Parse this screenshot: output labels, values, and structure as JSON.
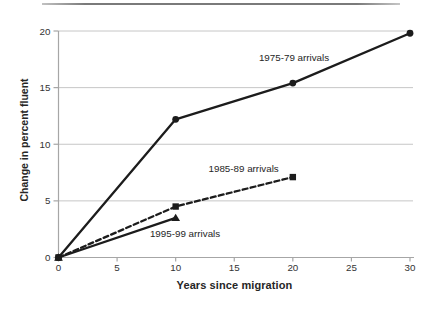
{
  "chart_data": {
    "type": "line",
    "title": "",
    "xlabel": "Years since migration",
    "ylabel": "Change in percent fluent",
    "xlim": [
      0,
      30
    ],
    "ylim": [
      0,
      20
    ],
    "x_ticks": [
      0,
      5,
      10,
      15,
      20,
      25,
      30
    ],
    "y_ticks": [
      0,
      5,
      10,
      15,
      20
    ],
    "grid": "horizontal-only",
    "legend_position": "inline-labels",
    "series": [
      {
        "name": "1975-79 arrivals",
        "x": [
          0,
          10,
          20,
          30
        ],
        "values": [
          0,
          12.2,
          15.4,
          19.8
        ],
        "line_style": "solid",
        "marker": "circle"
      },
      {
        "name": "1985-89 arrivals",
        "x": [
          0,
          10,
          20
        ],
        "values": [
          0,
          4.5,
          7.1
        ],
        "line_style": "dashed",
        "marker": "square"
      },
      {
        "name": "1995-99 arrivals",
        "x": [
          0,
          10
        ],
        "values": [
          0,
          3.5
        ],
        "line_style": "solid",
        "marker": "triangle"
      }
    ],
    "annotations": [
      {
        "text": "1975-79 arrivals",
        "x": 20.1,
        "y": 17.7
      },
      {
        "text": "1985-89 arrivals",
        "x": 15.8,
        "y": 7.9
      },
      {
        "text": "1995-99 arrivals",
        "x": 10.8,
        "y": 2.1
      }
    ],
    "colors": {
      "series": "#1c1c1c",
      "grid": "#c6c6c6",
      "axis": "#a6a6a6",
      "tick_text": "#333333",
      "label_text": "#262626",
      "background": "#ffffff",
      "top_rule": "#7a7a7a"
    }
  }
}
